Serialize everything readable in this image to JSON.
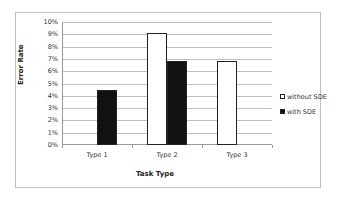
{
  "chart_data": {
    "type": "bar",
    "title": "",
    "xlabel": "Task Type",
    "ylabel": "Error Rate",
    "categories": [
      "Type 1",
      "Type 2",
      "Type 3"
    ],
    "series": [
      {
        "name": "without SDE",
        "color": "#ffffff",
        "values": [
          0,
          9.1,
          6.8
        ]
      },
      {
        "name": "with SDE",
        "color": "#111111",
        "values": [
          4.5,
          6.8,
          0
        ]
      }
    ],
    "ylim": [
      0,
      10
    ],
    "yticks": [
      "0%",
      "1%",
      "2%",
      "3%",
      "4%",
      "5%",
      "6%",
      "7%",
      "8%",
      "9%",
      "10%"
    ],
    "grid": true,
    "legend_position": "right"
  }
}
